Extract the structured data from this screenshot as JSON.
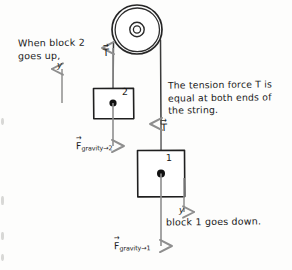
{
  "diagram": {
    "background_color": "#fdfdfc",
    "ink_color": "#1a1a1a",
    "arrow_color": "#8e8e8e",
    "notes": {
      "left": "When block 2\ngoes up,",
      "right": "The tension force T is\nequal at both ends of\nthe string.",
      "bottom_right": "block 1 goes down."
    },
    "axes": {
      "left_label": "y",
      "right_label": "y"
    },
    "tension": {
      "upper_label": "T",
      "lower_label": "T"
    },
    "forces": {
      "block2": {
        "symbol": "F",
        "subscript": "gravity→2"
      },
      "block1": {
        "symbol": "F",
        "subscript": "gravity→1"
      }
    },
    "blocks": {
      "block2_number": "2",
      "block1_number": "1"
    }
  }
}
